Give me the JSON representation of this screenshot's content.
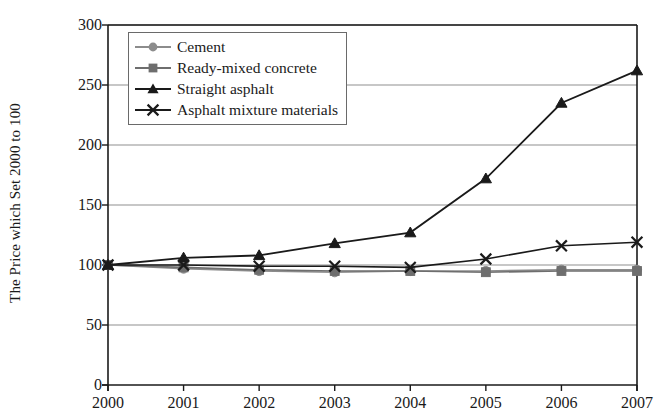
{
  "chart_data": {
    "type": "line",
    "title": "",
    "xlabel": "",
    "ylabel": "The Price which Set 2000 to 100",
    "categories": [
      "2000",
      "2001",
      "2002",
      "2003",
      "2004",
      "2005",
      "2006",
      "2007"
    ],
    "xlim": [
      2000,
      2007
    ],
    "ylim": [
      0,
      300
    ],
    "yticks": [
      0,
      50,
      100,
      150,
      200,
      250,
      300
    ],
    "ytick_labels": [
      "0",
      "50",
      "100",
      "150",
      "200",
      "250",
      "300"
    ],
    "grid": "horizontal",
    "legend_position": "upper left inside",
    "series": [
      {
        "name": "Cement",
        "marker": "circle",
        "color": "#8c8c8c",
        "values": [
          100,
          97,
          95,
          94,
          95,
          95,
          96,
          96
        ]
      },
      {
        "name": "Ready-mixed concrete",
        "marker": "square",
        "color": "#6e6e6e",
        "values": [
          100,
          98,
          96,
          95,
          95,
          94,
          95,
          95
        ]
      },
      {
        "name": "Straight asphalt",
        "marker": "triangle",
        "color": "#1a1a1a",
        "values": [
          100,
          106,
          108,
          118,
          127,
          172,
          235,
          262
        ]
      },
      {
        "name": "Asphalt mixture materials",
        "marker": "cross",
        "color": "#1a1a1a",
        "values": [
          100,
          100,
          99,
          99,
          98,
          105,
          116,
          119
        ]
      }
    ]
  }
}
